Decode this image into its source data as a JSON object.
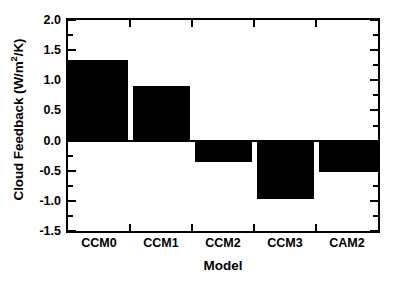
{
  "chart_data": {
    "type": "bar",
    "title": "",
    "xlabel": "Model",
    "ylabel": "Cloud Feedback (W/m",
    "ylabel_sup": "2",
    "ylabel_tail": "/K)",
    "ylabel_full": "Cloud Feedback (W/m 2/K)",
    "categories": [
      "CCM0",
      "CCM1",
      "CCM2",
      "CCM3",
      "CAM2"
    ],
    "values": [
      1.33,
      0.9,
      -0.35,
      -0.97,
      -0.52
    ],
    "ylim": [
      -1.5,
      2.0
    ],
    "ytick_labels": [
      "2.0",
      "1.5",
      "1.0",
      "0.5",
      "0.0",
      "-0.5",
      "-1.0",
      "-1.5"
    ],
    "ytick_values": [
      2.0,
      1.5,
      1.0,
      0.5,
      0.0,
      -0.5,
      -1.0,
      -1.5
    ],
    "yminor_values": [
      1.75,
      1.25,
      0.75,
      0.25,
      -0.25,
      -0.75,
      -1.25
    ],
    "grid": false,
    "legend": false,
    "bar_color": "#000000",
    "axis_color": "#000000",
    "background": "#ffffff"
  }
}
